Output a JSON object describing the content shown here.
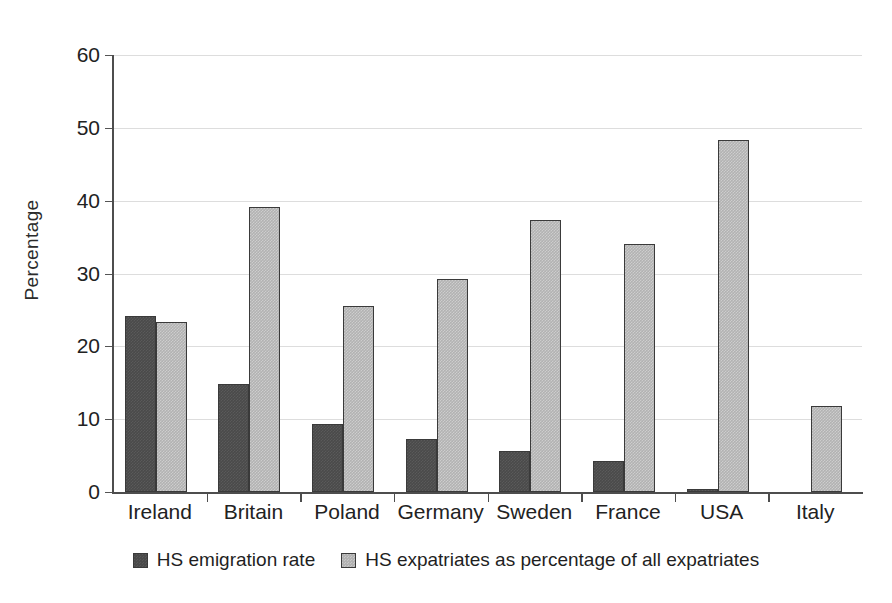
{
  "chart_data": {
    "type": "bar",
    "title": "",
    "subtitle": "",
    "xlabel": "",
    "ylabel": "Percentage",
    "ylim": [
      0,
      60
    ],
    "yticks": [
      0,
      10,
      20,
      30,
      40,
      50,
      60
    ],
    "ytick_labels": [
      "0",
      "10",
      "20",
      "30",
      "40",
      "50",
      "60"
    ],
    "grid": true,
    "grid_axis": "y",
    "legend_position": "bottom",
    "categories": [
      "Ireland",
      "Britain",
      "Poland",
      "Germany",
      "Sweden",
      "France",
      "USA",
      "Italy"
    ],
    "series": [
      {
        "name": "HS emigration rate",
        "color": "#4a4a4a",
        "values": [
          24.2,
          14.8,
          9.4,
          7.3,
          5.6,
          4.2,
          0.4,
          0
        ]
      },
      {
        "name": "HS expatriates as percentage of all expatriates",
        "color": "#b2b2b2",
        "values": [
          23.4,
          39.1,
          25.5,
          29.3,
          37.4,
          34.0,
          48.3,
          11.8
        ]
      }
    ]
  },
  "axis": {
    "y_title": "Percentage"
  },
  "legend": {
    "items": [
      {
        "label": "HS emigration rate",
        "swatch": "dark-square-swatch"
      },
      {
        "label": "HS expatriates as percentage of all expatriates",
        "swatch": "light-square-swatch"
      }
    ]
  },
  "colors": {
    "series_dark": "#4a4a4a",
    "series_light": "#b2b2b2",
    "gridline": "#dddddd",
    "axis": "#4d4d4d",
    "background": "#ffffff",
    "text": "#1f1f1f"
  }
}
